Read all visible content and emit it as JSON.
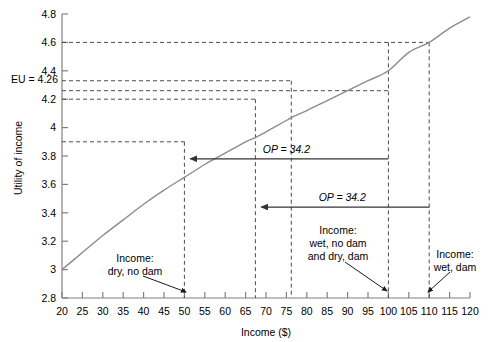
{
  "chart_data": {
    "type": "line",
    "title": "",
    "xlabel": "Income ($)",
    "ylabel": "Utility of income",
    "xlim": [
      20,
      120
    ],
    "ylim": [
      2.8,
      4.8
    ],
    "grid": false,
    "legend": "none",
    "x_ticks": [
      20,
      25,
      30,
      35,
      40,
      45,
      50,
      55,
      60,
      65,
      70,
      75,
      80,
      85,
      90,
      95,
      100,
      105,
      110,
      115,
      120
    ],
    "x_tick_labels": [
      "20",
      "25",
      "30",
      "35",
      "40",
      "45",
      "50",
      "55",
      "60",
      "65",
      "70",
      "75",
      "80",
      "85",
      "90",
      "95",
      "100",
      "105",
      "110",
      "115",
      "120"
    ],
    "y_ticks": [
      2.8,
      3.0,
      3.2,
      3.4,
      3.6,
      3.8,
      4.0,
      4.2,
      4.4,
      4.6,
      4.8
    ],
    "y_tick_labels": [
      "2.8",
      "3",
      "3.2",
      "3.4",
      "3.6",
      "3.8",
      "4",
      "4.2",
      "4.4",
      "4.6",
      "4.8"
    ],
    "series": [
      {
        "name": "Utility of income",
        "color": "#8c8c8c",
        "x": [
          20,
          25,
          30,
          35,
          40,
          45,
          50,
          55,
          60,
          65,
          67.4,
          70,
          75,
          76.2,
          80,
          85,
          90,
          95,
          100,
          105,
          110,
          115,
          120
        ],
        "y": [
          3.0,
          3.12,
          3.24,
          3.35,
          3.46,
          3.56,
          3.65,
          3.74,
          3.82,
          3.9,
          3.93,
          3.97,
          4.05,
          4.07,
          4.12,
          4.19,
          4.26,
          4.33,
          4.4,
          4.53,
          4.6,
          4.7,
          4.78
        ]
      }
    ],
    "reference_lines": {
      "vertical": [
        {
          "x": 50,
          "y_top": 3.9,
          "label": "dry-no-dam"
        },
        {
          "x": 67.4,
          "y_top": 4.2,
          "label": "certainty-equivalent-low"
        },
        {
          "x": 76.2,
          "y_top": 4.33,
          "label": "certainty-equivalent-high"
        },
        {
          "x": 100,
          "y_top": 4.6,
          "label": "wet-no-dam-and-dry-dam"
        },
        {
          "x": 110,
          "y_top": 4.6,
          "label": "wet-dam"
        }
      ],
      "horizontal": [
        {
          "y": 4.6,
          "x_right": 110
        },
        {
          "y": 4.33,
          "x_right": 76.2
        },
        {
          "y": 4.26,
          "x_right": 100
        },
        {
          "y": 4.2,
          "x_right": 67.4
        },
        {
          "y": 3.9,
          "x_right": 50
        }
      ]
    },
    "eu_label": "EU = 4.26",
    "eu_value": 4.26,
    "arrows": [
      {
        "label": "OP = 34.2",
        "value": 34.2,
        "from_x": 100,
        "to_x": 50,
        "y": 3.78
      },
      {
        "label": "OP = 34.2",
        "value": 34.2,
        "from_x": 110,
        "to_x": 67.4,
        "y": 3.44
      }
    ],
    "annotations": [
      {
        "lines": [
          "Income:",
          "dry, no dam"
        ],
        "points_to_x": 50
      },
      {
        "lines": [
          "Income:",
          "wet, no dam",
          "and dry, dam"
        ],
        "points_to_x": 100
      },
      {
        "lines": [
          "Income:",
          "wet, dam"
        ],
        "points_to_x": 110
      }
    ]
  },
  "colors": {
    "curve": "#8c8c8c",
    "axis": "#808080",
    "dashed": "#4d4d4d",
    "arrow": "#333333",
    "text": "#000000"
  }
}
